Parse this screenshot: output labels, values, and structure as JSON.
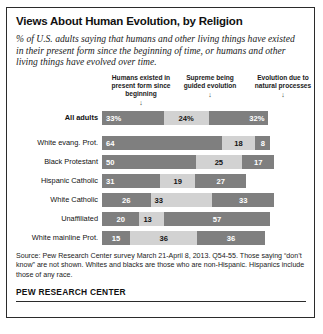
{
  "chart_data": {
    "type": "bar",
    "subtype": "stacked-horizontal-100",
    "title": "Views About Human Evolution, by Religion",
    "subtitle": "% of U.S. adults saying that humans and other living things have existed in their present form since the beginning of time, or humans and other living things have evolved over time.",
    "xlabel": "",
    "ylabel": "",
    "xlim": [
      0,
      100
    ],
    "grid": false,
    "legend_position": "top",
    "categories": [
      "All adults",
      "White evang. Prot.",
      "Black Protestant",
      "Hispanic Catholic",
      "White Catholic",
      "Unaffiliated",
      "White mainline Prot."
    ],
    "series": [
      {
        "name": "Humans existed in present form since beginning",
        "color": "#7f7f7f",
        "values": [
          33,
          64,
          50,
          31,
          26,
          20,
          15
        ]
      },
      {
        "name": "Supreme being guided evolution",
        "color": "#d2d2d2",
        "values": [
          24,
          18,
          25,
          19,
          33,
          13,
          36
        ]
      },
      {
        "name": "Evolution due to natural processes",
        "color": "#7f7f7f",
        "values": [
          32,
          8,
          17,
          27,
          33,
          57,
          36
        ]
      }
    ],
    "columns": [
      {
        "label": "Humans existed in present form since beginning",
        "arrow": "↓"
      },
      {
        "label": "Supreme being guided evolution",
        "arrow": "↓"
      },
      {
        "label": "Evolution due to natural processes",
        "arrow": "↓"
      }
    ],
    "rows": [
      {
        "label": "All adults",
        "emphasis": true,
        "segments": [
          {
            "value": "33%",
            "pct": 33,
            "tone": "dark",
            "align": "left"
          },
          {
            "value": "24%",
            "pct": 24,
            "tone": "light",
            "align": "center"
          },
          {
            "value": "32%",
            "pct": 32,
            "tone": "dark",
            "align": "right"
          }
        ]
      },
      {
        "label": "White evang. Prot.",
        "emphasis": false,
        "segments": [
          {
            "value": "64",
            "pct": 64,
            "tone": "dark",
            "align": "left"
          },
          {
            "value": "18",
            "pct": 18,
            "tone": "light",
            "align": "center"
          },
          {
            "value": "8",
            "pct": 8,
            "tone": "dark",
            "align": "center"
          }
        ]
      },
      {
        "label": "Black Protestant",
        "emphasis": false,
        "segments": [
          {
            "value": "50",
            "pct": 50,
            "tone": "dark",
            "align": "left"
          },
          {
            "value": "25",
            "pct": 25,
            "tone": "light",
            "align": "center"
          },
          {
            "value": "17",
            "pct": 17,
            "tone": "dark",
            "align": "center"
          }
        ]
      },
      {
        "label": "Hispanic Catholic",
        "emphasis": false,
        "segments": [
          {
            "value": "31",
            "pct": 31,
            "tone": "dark",
            "align": "left"
          },
          {
            "value": "19",
            "pct": 19,
            "tone": "light",
            "align": "center"
          },
          {
            "value": "27",
            "pct": 27,
            "tone": "dark",
            "align": "center"
          }
        ]
      },
      {
        "label": "White Catholic",
        "emphasis": false,
        "segments": [
          {
            "value": "26",
            "pct": 26,
            "tone": "dark",
            "align": "center"
          },
          {
            "value": "33",
            "pct": 33,
            "tone": "light",
            "align": "left"
          },
          {
            "value": "33",
            "pct": 33,
            "tone": "dark",
            "align": "center"
          }
        ]
      },
      {
        "label": "Unaffiliated",
        "emphasis": false,
        "segments": [
          {
            "value": "20",
            "pct": 20,
            "tone": "dark",
            "align": "center"
          },
          {
            "value": "13",
            "pct": 13,
            "tone": "light",
            "align": "left"
          },
          {
            "value": "57",
            "pct": 57,
            "tone": "dark",
            "align": "center"
          }
        ]
      },
      {
        "label": "White mainline Prot.",
        "emphasis": false,
        "segments": [
          {
            "value": "15",
            "pct": 15,
            "tone": "dark",
            "align": "center"
          },
          {
            "value": "36",
            "pct": 36,
            "tone": "light",
            "align": "center"
          },
          {
            "value": "36",
            "pct": 36,
            "tone": "dark",
            "align": "center"
          }
        ]
      }
    ]
  },
  "footer": {
    "source": "Source: Pew Research Center survey March 21-April 8, 2013. Q54-55. Those saying “don’t know” are not shown. Whites and blacks are those who are non-Hispanic. Hispanics include those of any race.",
    "brand": "PEW RESEARCH CENTER"
  },
  "colors": {
    "bar_dark": "#7f7f7f",
    "bar_light": "#d2d2d2",
    "border": "#2b2b2b",
    "text": "#1a1a1a"
  }
}
